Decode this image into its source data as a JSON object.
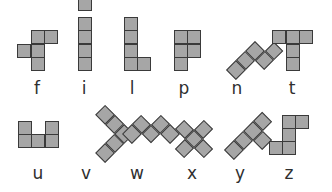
{
  "cell_color": "#a6a6a6",
  "border_color": "#3a3a3a",
  "pieces": [
    {
      "name": "f",
      "label": "f"
    },
    {
      "name": "i",
      "label": "i"
    },
    {
      "name": "l",
      "label": "l"
    },
    {
      "name": "p",
      "label": "p"
    },
    {
      "name": "n",
      "label": "n"
    },
    {
      "name": "t",
      "label": "t"
    },
    {
      "name": "u",
      "label": "u"
    },
    {
      "name": "v",
      "label": "v"
    },
    {
      "name": "w",
      "label": "w"
    },
    {
      "name": "x",
      "label": "x"
    },
    {
      "name": "y",
      "label": "y"
    },
    {
      "name": "z",
      "label": "z"
    }
  ]
}
